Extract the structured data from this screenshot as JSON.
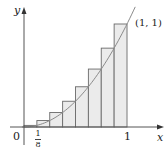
{
  "figure": {
    "function": "y = x^2",
    "n_rectangles": 8,
    "interval": [
      0,
      1
    ],
    "labels": {
      "y_axis": "y",
      "x_axis": "x",
      "origin": "0",
      "first_tick_num": "1",
      "first_tick_den": "8",
      "one_tick": "1",
      "point": "(1, 1)"
    },
    "colors": {
      "axis": "#555555",
      "rect_fill": "#ebebeb",
      "rect_stroke": "#6a6a6a",
      "curve": "#8a8a8a"
    },
    "rectangles": [
      {
        "x0": 0,
        "x1": 0.125,
        "height": 0.015625
      },
      {
        "x0": 0.125,
        "x1": 0.25,
        "height": 0.0625
      },
      {
        "x0": 0.25,
        "x1": 0.375,
        "height": 0.140625
      },
      {
        "x0": 0.375,
        "x1": 0.5,
        "height": 0.25
      },
      {
        "x0": 0.5,
        "x1": 0.625,
        "height": 0.390625
      },
      {
        "x0": 0.625,
        "x1": 0.75,
        "height": 0.5625
      },
      {
        "x0": 0.75,
        "x1": 0.875,
        "height": 0.765625
      },
      {
        "x0": 0.875,
        "x1": 1,
        "height": 1
      }
    ]
  }
}
